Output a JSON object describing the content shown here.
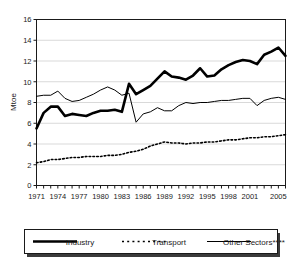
{
  "chart_data": {
    "type": "line",
    "title": "",
    "xlabel": "",
    "ylabel": "Mtoe",
    "ylim": [
      0,
      16
    ],
    "ytick_values": [
      0,
      2,
      4,
      6,
      8,
      10,
      12,
      14,
      16
    ],
    "ytick_labels": [
      "0",
      "2",
      "4",
      "6",
      "8",
      "10",
      "12",
      "14",
      "16"
    ],
    "xlim": [
      1971,
      2006
    ],
    "x": [
      1971,
      1972,
      1973,
      1974,
      1975,
      1976,
      1977,
      1978,
      1979,
      1980,
      1981,
      1982,
      1983,
      1984,
      1985,
      1986,
      1987,
      1988,
      1989,
      1990,
      1991,
      1992,
      1993,
      1994,
      1995,
      1996,
      1997,
      1998,
      1999,
      2000,
      2001,
      2002,
      2003,
      2004,
      2005,
      2006
    ],
    "xtick_labels": [
      "1971",
      "1974",
      "1977",
      "1980",
      "1983",
      "1986",
      "1989",
      "1992",
      "1995",
      "1998",
      "2001",
      "2005"
    ],
    "xtick_values": [
      1971,
      1974,
      1977,
      1980,
      1983,
      1986,
      1989,
      1992,
      1995,
      1998,
      2001,
      2005
    ],
    "grid": "horizontal",
    "legend_position": "bottom",
    "series": [
      {
        "name": "Industry",
        "style": "thick-solid",
        "color": "#000000",
        "values": [
          5.5,
          7.0,
          7.6,
          7.6,
          6.7,
          6.9,
          6.8,
          6.7,
          7.0,
          7.2,
          7.2,
          7.3,
          7.1,
          9.8,
          8.8,
          9.2,
          9.6,
          10.3,
          11.0,
          10.5,
          10.4,
          10.2,
          10.6,
          11.3,
          10.5,
          10.6,
          11.2,
          11.6,
          11.9,
          12.1,
          12.0,
          11.7,
          12.6,
          12.9,
          13.3,
          12.5
        ]
      },
      {
        "name": "Transport",
        "style": "dotted",
        "color": "#000000",
        "values": [
          2.2,
          2.3,
          2.5,
          2.5,
          2.6,
          2.7,
          2.7,
          2.8,
          2.8,
          2.8,
          2.9,
          2.9,
          3.0,
          3.2,
          3.3,
          3.5,
          3.8,
          4.0,
          4.2,
          4.1,
          4.1,
          4.0,
          4.1,
          4.1,
          4.2,
          4.2,
          4.3,
          4.4,
          4.4,
          4.5,
          4.6,
          4.6,
          4.7,
          4.7,
          4.8,
          4.9
        ]
      },
      {
        "name": "Other Sectors****",
        "style": "thin-solid",
        "color": "#000000",
        "values": [
          8.6,
          8.7,
          8.7,
          9.1,
          8.4,
          8.1,
          8.2,
          8.5,
          8.8,
          9.2,
          9.5,
          9.2,
          8.7,
          8.9,
          6.1,
          6.9,
          7.1,
          7.5,
          7.2,
          7.2,
          7.7,
          8.0,
          7.9,
          8.0,
          8.0,
          8.1,
          8.2,
          8.2,
          8.3,
          8.4,
          8.4,
          7.7,
          8.2,
          8.4,
          8.5,
          8.3
        ]
      }
    ]
  },
  "legend": {
    "items": [
      {
        "label": "Industry",
        "style": "thick-solid"
      },
      {
        "label": "Transport",
        "style": "dotted"
      },
      {
        "label": "Other Sectors****",
        "style": "thin-solid"
      }
    ]
  },
  "colors": {
    "ink": "#000000",
    "grid": "#d9d9d9",
    "axis": "#1a1a1a",
    "background": "#ffffff",
    "legend_shadow": "#3b3b3b"
  }
}
